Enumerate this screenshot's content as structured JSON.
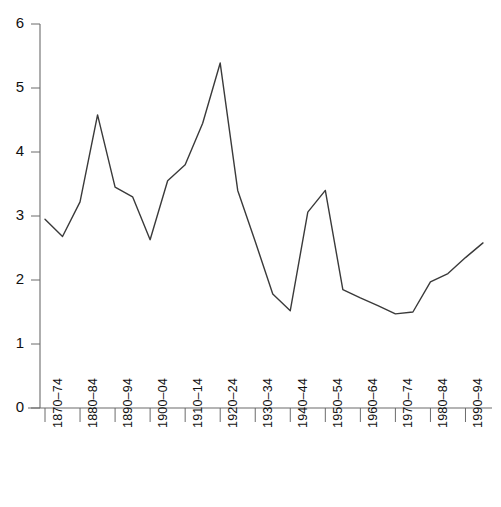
{
  "chart_data": {
    "type": "line",
    "title": "",
    "subtitle": "",
    "xlabel": "",
    "ylabel": "",
    "xlim": [
      0,
      25
    ],
    "ylim": [
      0,
      6
    ],
    "yticks": [
      0,
      1,
      2,
      3,
      4,
      5,
      6
    ],
    "grid": false,
    "legend": false,
    "categories": [
      "1870-74",
      "1875-79",
      "1880-84",
      "1885-89",
      "1890-94",
      "1895-99",
      "1900-04",
      "1905-09",
      "1910-14",
      "1915-19",
      "1920-24",
      "1925-29",
      "1930-34",
      "1935-39",
      "1940-44",
      "1945-49",
      "1950-54",
      "1955-59",
      "1960-64",
      "1965-69",
      "1970-74",
      "1975-79",
      "1980-84",
      "1985-89",
      "1990-94",
      "1995-99"
    ],
    "values": [
      2.95,
      2.68,
      3.22,
      4.58,
      3.45,
      3.3,
      2.63,
      3.55,
      3.8,
      4.45,
      5.39,
      3.4,
      2.6,
      1.78,
      1.52,
      3.06,
      3.4,
      1.85,
      1.72,
      1.6,
      1.47,
      1.5,
      1.97,
      2.1,
      2.35,
      2.58
    ],
    "tick_labels": [
      "1870-74",
      "1880-84",
      "1890-94",
      "1900-04",
      "1910-14",
      "1920-24",
      "1930-34",
      "1940-44",
      "1950-54",
      "1960-64",
      "1970-74",
      "1980-84",
      "1990-94"
    ],
    "tick_label_indices": [
      0,
      2,
      4,
      6,
      8,
      10,
      12,
      14,
      16,
      18,
      20,
      22,
      24
    ],
    "line_color": "#3a3a3a",
    "axis_color": "#6b6b6b"
  },
  "axes": {
    "y_tick_labels": [
      "6",
      "5",
      "4",
      "3",
      "2",
      "1",
      "0"
    ]
  }
}
